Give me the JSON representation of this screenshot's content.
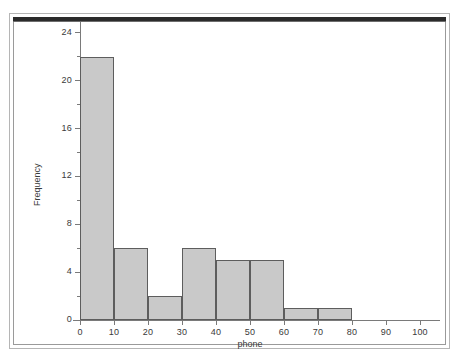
{
  "figure": {
    "background_color": "#ffffff",
    "frame_color": "#9a9a9a",
    "bar_fill_color": "#c9c9c9",
    "bar_edge_color": "#5d5d5d",
    "axis_color": "#7a7a7a",
    "text_color": "#3a3a3a"
  },
  "chart_data": {
    "type": "bar",
    "title": "",
    "subtitle": "",
    "xlabel": "phone",
    "ylabel": "Frequency",
    "xlim": [
      -5,
      110
    ],
    "ylim": [
      0,
      25.5
    ],
    "grid": false,
    "legend": null,
    "bin_width": 10,
    "bin_edges": [
      0,
      10,
      20,
      30,
      40,
      50,
      60,
      70,
      80
    ],
    "categories": [
      "0-10",
      "10-20",
      "20-30",
      "30-40",
      "40-50",
      "50-60",
      "60-70",
      "70-80"
    ],
    "values": [
      22,
      6,
      2,
      6,
      5,
      5,
      1,
      1
    ],
    "bars": [
      {
        "x0": 0,
        "x1": 10,
        "height": 22
      },
      {
        "x0": 10,
        "x1": 20,
        "height": 6
      },
      {
        "x0": 20,
        "x1": 30,
        "height": 2
      },
      {
        "x0": 30,
        "x1": 40,
        "height": 6
      },
      {
        "x0": 40,
        "x1": 50,
        "height": 5
      },
      {
        "x0": 50,
        "x1": 60,
        "height": 5
      },
      {
        "x0": 60,
        "x1": 70,
        "height": 1
      },
      {
        "x0": 70,
        "x1": 80,
        "height": 1
      }
    ],
    "xticks": [
      0,
      10,
      20,
      30,
      40,
      50,
      60,
      70,
      80,
      90,
      100
    ],
    "xticklabels": [
      "0",
      "10",
      "20",
      "30",
      "40",
      "50",
      "60",
      "70",
      "80",
      "90",
      "100"
    ],
    "yticks": [
      0,
      4,
      8,
      12,
      16,
      20,
      24
    ],
    "yticklabels": [
      "0",
      "4",
      "8",
      "12",
      "16",
      "20",
      "24"
    ],
    "yminorticks": [
      2,
      6,
      10,
      14,
      18,
      22
    ]
  }
}
